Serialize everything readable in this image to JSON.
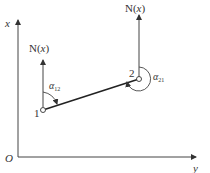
{
  "diagram": {
    "type": "coordinate-azimuth-diagram",
    "axes": {
      "origin_label": "O",
      "vertical_label": "x",
      "horizontal_label": "y"
    },
    "points": [
      {
        "id": "1",
        "label": "1"
      },
      {
        "id": "2",
        "label": "2"
      }
    ],
    "north_arrows": [
      {
        "at": "1",
        "label_prefix": "N(",
        "label_var": "x",
        "label_suffix": ")"
      },
      {
        "at": "2",
        "label_prefix": "N(",
        "label_var": "x",
        "label_suffix": ")"
      }
    ],
    "angles": [
      {
        "symbol": "α",
        "subscript": "12",
        "at": "1"
      },
      {
        "symbol": "α",
        "subscript": "21",
        "at": "2"
      }
    ],
    "colors": {
      "line": "#333333",
      "thick_line": "#222222",
      "background": "#ffffff"
    }
  }
}
